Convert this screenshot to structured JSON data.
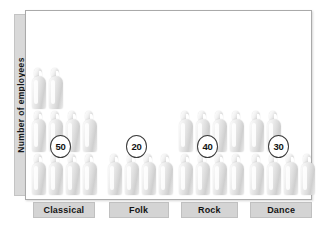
{
  "chart_data": {
    "type": "bar",
    "subtype": "pictogram",
    "title": "",
    "xlabel": "",
    "ylabel": "Number of employees",
    "categories": [
      "Classical",
      "Folk",
      "Rock",
      "Dance"
    ],
    "values": [
      50,
      20,
      40,
      30
    ],
    "value_labels": [
      "50",
      "20",
      "40",
      "30"
    ],
    "icon_counts": [
      10,
      4,
      8,
      6
    ],
    "icons_per_row": 4,
    "icon_unit_value": 5,
    "icon_name": "person-icon",
    "grid": false,
    "legend": null,
    "ylim": [
      0,
      50
    ]
  },
  "axis": {
    "y_label": "Number of employees"
  },
  "colors": {
    "plot_background": "#ffffff",
    "plot_border": "#aaaaaa",
    "label_band": "#d4d4d4",
    "axis_band": "#d9d9d9",
    "icon_light": "#fbfbfb",
    "icon_shadow": "#cfcfcf",
    "bubble_border": "#3c3c3c",
    "text": "#141414"
  }
}
